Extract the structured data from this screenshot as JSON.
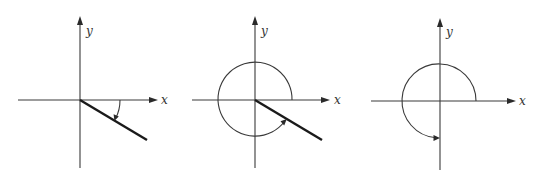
{
  "figure": {
    "colors": {
      "axis": "#3a3a3a",
      "terminal_side": "#1a1a1a",
      "background": "#ffffff"
    },
    "panels": [
      {
        "id": "panel-1",
        "x_label": "x",
        "y_label": "y",
        "origin": [
          80,
          100
        ],
        "terminal_side": {
          "from": [
            80,
            100
          ],
          "to": [
            147,
            140
          ]
        },
        "angle_arc": {
          "type": "clockwise",
          "radius": 40,
          "approx_degrees": -30
        }
      },
      {
        "id": "panel-2",
        "x_label": "x",
        "y_label": "y",
        "origin": [
          255,
          100
        ],
        "terminal_side": {
          "from": [
            255,
            100
          ],
          "to": [
            322,
            140
          ]
        },
        "angle_arc": {
          "type": "counterclockwise",
          "radius": 37,
          "approx_degrees": 330
        }
      },
      {
        "id": "panel-3",
        "x_label": "x",
        "y_label": "y",
        "origin": [
          440,
          101
        ],
        "terminal_side": null,
        "angle_arc": {
          "type": "counterclockwise",
          "radius": 37,
          "approx_degrees": 270
        }
      }
    ]
  }
}
